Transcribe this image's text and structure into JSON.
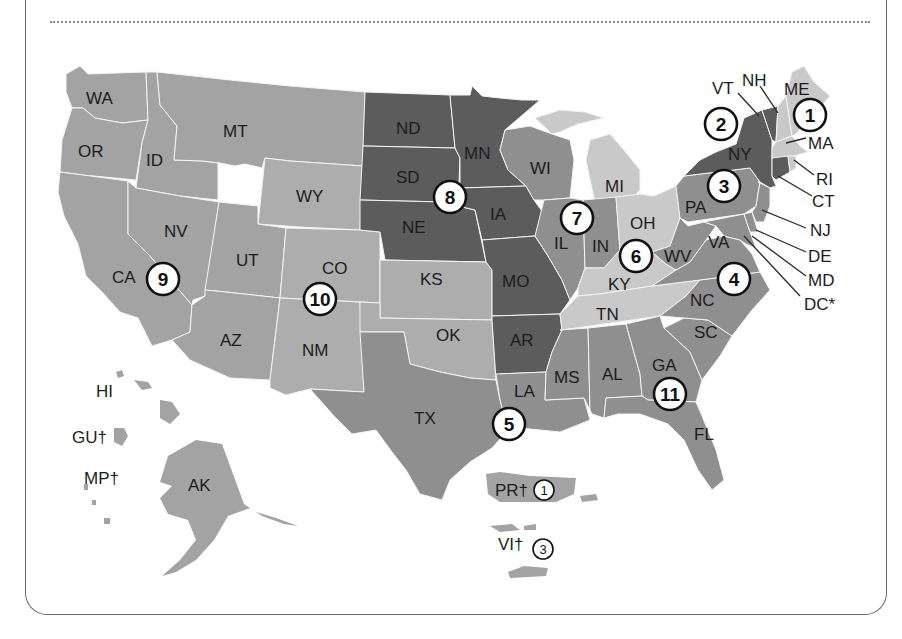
{
  "shades": {
    "dark": "#5c5c5c",
    "midDark": "#8f8f8f",
    "mid": "#a2a2a2",
    "midLight": "#afafaf",
    "light": "#c9c9c9",
    "border": "#f4f4f4"
  },
  "regions": [
    {
      "number": "1",
      "label": "1"
    },
    {
      "number": "2",
      "label": "2"
    },
    {
      "number": "3",
      "label": "3"
    },
    {
      "number": "4",
      "label": "4"
    },
    {
      "number": "5",
      "label": "5"
    },
    {
      "number": "6",
      "label": "6"
    },
    {
      "number": "7",
      "label": "7"
    },
    {
      "number": "8",
      "label": "8"
    },
    {
      "number": "9",
      "label": "9"
    },
    {
      "number": "10",
      "label": "10"
    },
    {
      "number": "11",
      "label": "11"
    }
  ],
  "states": {
    "WA": "WA",
    "OR": "OR",
    "CA": "CA",
    "ID": "ID",
    "NV": "NV",
    "MT": "MT",
    "WY": "WY",
    "UT": "UT",
    "AZ": "AZ",
    "CO": "CO",
    "NM": "NM",
    "ND": "ND",
    "SD": "SD",
    "NE": "NE",
    "KS": "KS",
    "OK": "OK",
    "TX": "TX",
    "MN": "MN",
    "IA": "IA",
    "MO": "MO",
    "AR": "AR",
    "LA": "LA",
    "WI": "WI",
    "IL": "IL",
    "MI": "MI",
    "IN": "IN",
    "OH": "OH",
    "KY": "KY",
    "TN": "TN",
    "MS": "MS",
    "AL": "AL",
    "GA": "GA",
    "FL": "FL",
    "SC": "SC",
    "NC": "NC",
    "VA": "VA",
    "WV": "WV",
    "PA": "PA",
    "NY": "NY",
    "VT": "VT",
    "NH": "NH",
    "ME": "ME",
    "MA": "MA",
    "RI": "RI",
    "CT": "CT",
    "NJ": "NJ",
    "DE": "DE",
    "MD": "MD",
    "DC": "DC*",
    "HI": "HI",
    "AK": "AK",
    "GU": "GU†",
    "MP": "MP†",
    "PR": "PR†",
    "VI": "VI†"
  },
  "territory_regions": {
    "PR": "1",
    "VI": "3"
  }
}
